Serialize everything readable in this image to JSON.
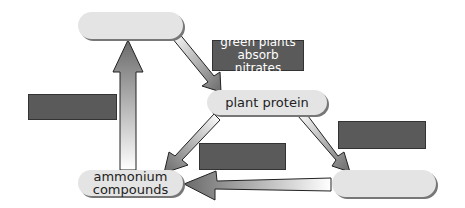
{
  "diagram": {
    "nodes": {
      "top": {
        "label": ""
      },
      "plant_protein": {
        "label": "plant protein"
      },
      "ammonium_line1": {
        "label": "ammonium"
      },
      "ammonium_line2": {
        "label": "compounds"
      },
      "bottom_right": {
        "label": ""
      }
    },
    "labels": {
      "green_plants_line1": "green plants",
      "green_plants_line2": "absorb nitrates",
      "blank_left": "",
      "blank_middle": "",
      "blank_right": ""
    },
    "colors": {
      "node_fill": "#e4e4e4",
      "label_fill": "#5a5a5a",
      "arrow_dark": "#6a6a6a",
      "arrow_light": "#ffffff"
    }
  }
}
